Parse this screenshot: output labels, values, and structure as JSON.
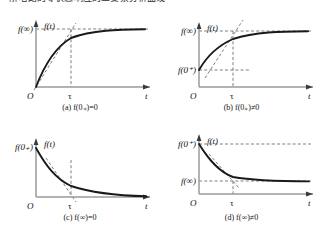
{
  "heading": {
    "text": "一阶电路的零状态响应的三要素分析曲线",
    "clipped": true
  },
  "figure": {
    "axis_color": "#9a9a9a",
    "curve_color": "#1a1a1a",
    "dash_color": "#6f6f6f",
    "time_constant_symbol": "τ",
    "origin_label": "O",
    "yaxis_label": "f(t)",
    "xaxis_label": "t",
    "panels": [
      {
        "id": "a",
        "caption": "(a) f(0₊)=0",
        "caption_parts": {
          "tag": "(a)",
          "fn": "f",
          "arg": "(0₊)",
          "rel": "=0"
        },
        "type": "rising",
        "y_labels": [
          {
            "text": "f(∞)",
            "role": "final-value"
          }
        ],
        "start_value": 0,
        "final_value": 1,
        "tangent_at_tau": true,
        "asymptote": true
      },
      {
        "id": "b",
        "caption": "(b) f(0₊)≠0",
        "caption_parts": {
          "tag": "(b)",
          "fn": "f",
          "arg": "(0₊)",
          "rel": "≠0"
        },
        "type": "rising",
        "y_labels": [
          {
            "text": "f(∞)",
            "role": "final-value"
          },
          {
            "text": "f(0⁺)",
            "role": "initial-value"
          }
        ],
        "start_value": 0.22,
        "final_value": 1,
        "tangent_at_tau": true,
        "asymptote": true
      },
      {
        "id": "c",
        "caption": "(c) f(∞)=0",
        "caption_parts": {
          "tag": "(c)",
          "fn": "f",
          "arg": "(∞)",
          "rel": "=0"
        },
        "type": "decaying",
        "y_labels": [
          {
            "text": "f(0₊)",
            "role": "initial-value"
          }
        ],
        "start_value": 1,
        "final_value": 0,
        "tangent_at_tau": true,
        "asymptote": false
      },
      {
        "id": "d",
        "caption": "(d) f(∞)≠0",
        "caption_parts": {
          "tag": "(d)",
          "fn": "f",
          "arg": "(∞)",
          "rel": "≠0"
        },
        "type": "decaying",
        "y_labels": [
          {
            "text": "f(0⁺)",
            "role": "initial-value"
          },
          {
            "text": "f(∞)",
            "role": "final-value"
          }
        ],
        "start_value": 1,
        "final_value": 0.18,
        "tangent_at_tau": true,
        "asymptote": true
      }
    ]
  }
}
